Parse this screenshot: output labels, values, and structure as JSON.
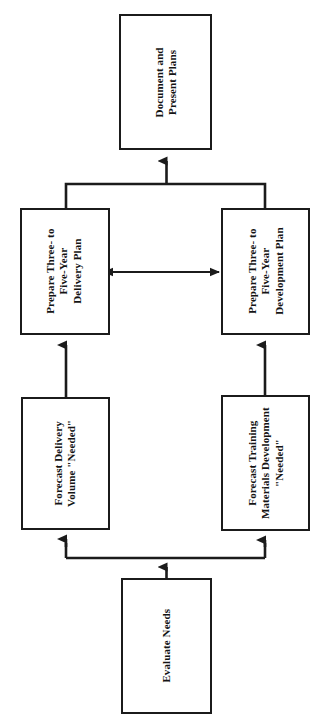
{
  "diagram": {
    "orientation": "rotated-90",
    "colors": {
      "box_border": "#1b1b1b",
      "box_fill": "#ffffff",
      "connector": "#1b1b1b",
      "page_background": "#ffffff"
    },
    "nodes": [
      {
        "id": "document-present-plans",
        "name": "document-and-present-plans-box",
        "lines": [
          "Document and",
          "Present Plans"
        ],
        "x": 119,
        "y": 14,
        "w": 93,
        "h": 136
      },
      {
        "id": "prepare-delivery-plan",
        "name": "prepare-three-to-five-year-delivery-plan-box",
        "lines": [
          "Prepare Three- to",
          "Five-Year",
          "Delivery Plan"
        ],
        "x": 20,
        "y": 208,
        "w": 90,
        "h": 127
      },
      {
        "id": "prepare-development-plan",
        "name": "prepare-three-to-five-year-development-plan-box",
        "lines": [
          "Prepare Three- to",
          "Five-Year",
          "Development Plan"
        ],
        "x": 221,
        "y": 208,
        "w": 89,
        "h": 127
      },
      {
        "id": "forecast-delivery-volume",
        "name": "forecast-delivery-volume-needed-box",
        "lines": [
          "Forecast Delivery",
          "Volume \"Needed\""
        ],
        "x": 21,
        "y": 397,
        "w": 89,
        "h": 133
      },
      {
        "id": "forecast-training-materials",
        "name": "forecast-training-materials-development-needed-box",
        "lines": [
          "Forecast Training",
          "Materials Development",
          "\"Needed\""
        ],
        "x": 221,
        "y": 395,
        "w": 89,
        "h": 136
      },
      {
        "id": "evaluate-needs",
        "name": "evaluate-needs-box",
        "lines": [
          "Evaluate Needs"
        ],
        "x": 121,
        "y": 578,
        "w": 91,
        "h": 136
      }
    ],
    "connectors": [
      {
        "id": "evaluate-to-junction",
        "name": "connector-evaluate-needs-to-forecast-junction",
        "from": "evaluate-needs",
        "to": "forecast-junction",
        "arrow": "single",
        "direction": "up"
      },
      {
        "id": "junction-to-forecast-delivery",
        "name": "connector-junction-to-forecast-delivery-volume",
        "from": "forecast-junction",
        "to": "forecast-delivery-volume",
        "arrow": "single",
        "direction": "up"
      },
      {
        "id": "junction-to-forecast-training",
        "name": "connector-junction-to-forecast-training-materials",
        "from": "forecast-junction",
        "to": "forecast-training-materials",
        "arrow": "single",
        "direction": "up"
      },
      {
        "id": "forecast-delivery-to-prepare-delivery",
        "name": "connector-forecast-delivery-to-prepare-delivery-plan",
        "from": "forecast-delivery-volume",
        "to": "prepare-delivery-plan",
        "arrow": "single",
        "direction": "up"
      },
      {
        "id": "forecast-training-to-prepare-development",
        "name": "connector-forecast-training-to-prepare-development-plan",
        "from": "forecast-training-materials",
        "to": "prepare-development-plan",
        "arrow": "single",
        "direction": "up"
      },
      {
        "id": "prepare-plans-exchange",
        "name": "connector-bidirectional-between-prepare-plans",
        "from": "prepare-delivery-plan",
        "to": "prepare-development-plan",
        "arrow": "double",
        "direction": "horizontal"
      },
      {
        "id": "prepare-plans-to-document",
        "name": "connector-prepare-plans-merge-to-document-present-plans",
        "from": [
          "prepare-delivery-plan",
          "prepare-development-plan"
        ],
        "to": "document-present-plans",
        "arrow": "single",
        "direction": "up"
      }
    ]
  }
}
